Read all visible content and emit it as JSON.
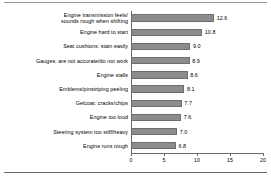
{
  "chart_data": {
    "type": "bar",
    "orientation": "horizontal",
    "title": "",
    "subtitle": "",
    "xlabel": "",
    "ylabel": "",
    "xlim": [
      0,
      20
    ],
    "grid": false,
    "legend": null,
    "bar_color": "#8c8c8c",
    "axis_color": "#6a6a6a",
    "tick_labels": [
      "0",
      "5",
      "10",
      "15",
      "20"
    ],
    "tick_values": [
      0,
      5,
      10,
      15,
      20
    ],
    "categories": [
      "Engine transmission feels/\nsounds rough when shifting",
      "Engine hard to start",
      "Seat cushions: stain easily",
      "Gauges: are not accurate/do not work",
      "Engine stalls",
      "Emblems/pinstriping peeling",
      "Gelcoat: cracks/chips",
      "Engine too loud",
      "Steering system too stiff/heavy",
      "Engine runs rough"
    ],
    "values": [
      12.6,
      10.8,
      9.0,
      8.9,
      8.6,
      8.1,
      7.7,
      7.6,
      7.0,
      6.8
    ],
    "value_labels": [
      "12.6",
      "10.8",
      "9.0",
      "8.9",
      "8.6",
      "8.1",
      "7.7",
      "7.6",
      "7.0",
      "6.8"
    ]
  }
}
